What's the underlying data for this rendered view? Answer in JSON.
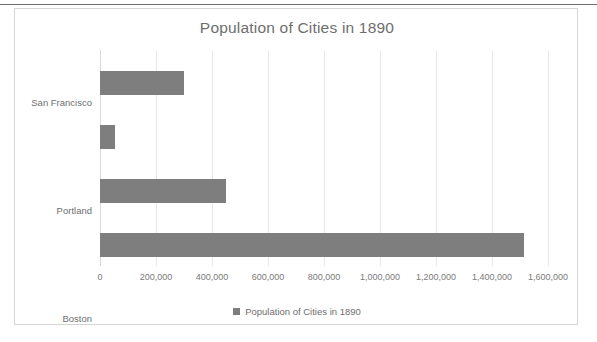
{
  "chart_data": {
    "type": "bar",
    "orientation": "horizontal",
    "title": "Population of Cities in 1890",
    "categories": [
      "San Francisco",
      "Portland",
      "Boston",
      "New York City"
    ],
    "values": [
      300000,
      54000,
      450000,
      1515000
    ],
    "series": [
      {
        "name": "Population of Cities in 1890",
        "values": [
          300000,
          54000,
          450000,
          1515000
        ]
      }
    ],
    "xlabel": "",
    "ylabel": "",
    "xlim": [
      0,
      1600000
    ],
    "xticks": [
      0,
      200000,
      400000,
      600000,
      800000,
      1000000,
      1200000,
      1400000,
      1600000
    ],
    "xtick_labels": [
      "0",
      "200,000",
      "400,000",
      "600,000",
      "800,000",
      "1,000,000",
      "1,200,000",
      "1,400,000",
      "1,600,000"
    ],
    "grid": true,
    "grid_axis": "x",
    "legend": {
      "position": "bottom",
      "entries": [
        "Population of Cities in 1890"
      ]
    },
    "colors": {
      "bar": "#7E7E7E",
      "title_text": "#6E6E6E",
      "tick_text": "#7A7A7A",
      "gridline": "#E8E8E8",
      "frame_border": "#D5D5D5",
      "background": "#FFFFFF"
    }
  }
}
